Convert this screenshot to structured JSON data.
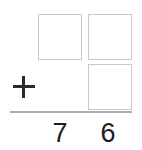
{
  "problem": {
    "type": "column-addition",
    "operator": "+",
    "answer_boxes": [
      {
        "name": "addend-top-tens",
        "place": "tens",
        "row": 1,
        "value": ""
      },
      {
        "name": "addend-top-ones",
        "place": "ones",
        "row": 1,
        "value": ""
      },
      {
        "name": "addend-bottom-ones",
        "place": "ones",
        "row": 2,
        "value": ""
      }
    ],
    "sum": {
      "tens": "7",
      "ones": "6",
      "full": "76"
    }
  },
  "style": {
    "box_border_color": "#c9c9c9",
    "rule_color": "#adadad",
    "digit_color": "#1e1e1e",
    "operator_color": "#2b2b2b",
    "background": "#ffffff"
  }
}
